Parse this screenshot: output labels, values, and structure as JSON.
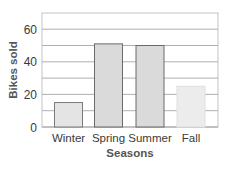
{
  "chart_data": {
    "type": "bar",
    "title": "",
    "xlabel": "Seasons",
    "ylabel": "Bikes sold",
    "categories": [
      "Winter",
      "Spring",
      "Summer",
      "Fall"
    ],
    "values": [
      15,
      51,
      50,
      25
    ],
    "ylim": [
      0,
      70
    ],
    "yticks": [
      0,
      20,
      40,
      60
    ],
    "grid": true,
    "grid_step": 10,
    "legend": null,
    "bar_colors": [
      "#e4e4e4",
      "#dadada",
      "#dadada",
      "#ececec"
    ],
    "bar_edge_colors": [
      "#7a7a7a",
      "#6a6a6a",
      "#6a6a6a",
      "#e0e0e0"
    ]
  },
  "colors": {
    "grid": "#9a9a9a",
    "frame": "#b5b5b5",
    "text": "#3a3a3a"
  }
}
